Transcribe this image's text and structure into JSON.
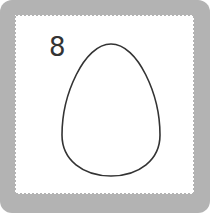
{
  "card": {
    "number": "8",
    "shape": "egg-outline",
    "frame_color": "#b3b3b3",
    "card_color": "#ffffff",
    "stroke_color": "#333333"
  }
}
